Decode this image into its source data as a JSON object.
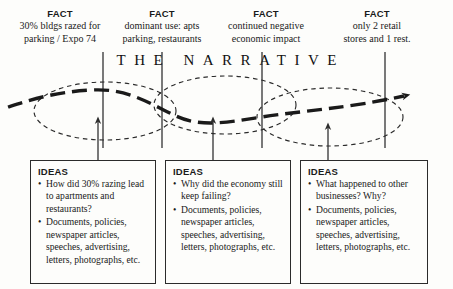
{
  "diagram": {
    "title_plain": "THE NARRATIVE",
    "facts": [
      {
        "label": "FACT",
        "lines": [
          "30% bldgs razed for",
          "parking / Expo 74"
        ]
      },
      {
        "label": "FACT",
        "lines": [
          "dominant use: apts",
          "parking, restaurants"
        ]
      },
      {
        "label": "FACT",
        "lines": [
          "continued negative",
          "economic impact"
        ]
      },
      {
        "label": "FACT",
        "lines": [
          "only 2 retail",
          "stores and 1 rest."
        ]
      }
    ],
    "ideas": [
      {
        "label": "IDEAS",
        "bullet": "•",
        "items": [
          "How did 30% razing lead to apartments and restaurants?",
          "Documents, policies, newspaper articles, speeches, advertising, letters, photographs, etc."
        ]
      },
      {
        "label": "IDEAS",
        "bullet": "•",
        "items": [
          "Why did the economy still keep failing?",
          "Documents, policies, newspaper articles, speeches, advertising, letters, photographs, etc."
        ]
      },
      {
        "label": "IDEAS",
        "bullet": "•",
        "items": [
          "What happened to other businesses?  Why?",
          "Documents, policies, newspaper articles, speeches, advertising, letters, photographs, etc."
        ]
      }
    ],
    "colors": {
      "ink": "#1a1a1a",
      "line": "#2b2b2b",
      "background": "#fdfdfb"
    }
  }
}
